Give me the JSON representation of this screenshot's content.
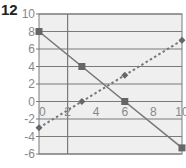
{
  "problem_number": "12",
  "chart_data": {
    "type": "line",
    "title": "",
    "xlabel": "",
    "ylabel": "",
    "xlim": [
      0,
      10
    ],
    "ylim": [
      -6,
      10
    ],
    "x_ticks": [
      0,
      2,
      4,
      6,
      8,
      10
    ],
    "y_ticks": [
      10,
      8,
      6,
      4,
      2,
      0,
      -2,
      -4,
      -6
    ],
    "grid": {
      "horizontal_every": 2,
      "vertical_at": [
        2
      ]
    },
    "legend": null,
    "series": [
      {
        "name": "solid line",
        "style": "solid",
        "marker": "square",
        "x": [
          0,
          3,
          6,
          10
        ],
        "y": [
          8,
          4,
          0,
          -5.3
        ]
      },
      {
        "name": "dashed line",
        "style": "dashed",
        "marker": "diamond",
        "x": [
          0,
          3,
          6,
          10
        ],
        "y": [
          -3,
          0,
          3,
          7
        ]
      }
    ]
  },
  "colors": {
    "plot_background": "#efefef",
    "grid": "#7a7a7a",
    "line": "#777777",
    "tick_label": "#888888"
  }
}
